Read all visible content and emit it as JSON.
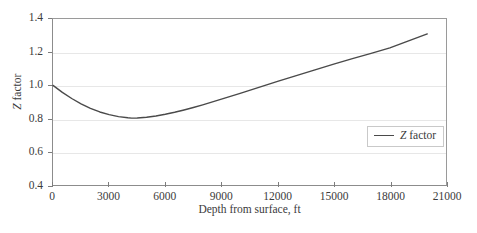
{
  "chart_data": {
    "type": "line",
    "title": "",
    "xlabel": "Depth from surface, ft",
    "ylabel": "Z factor",
    "ylabel_italic_prefix": "Z",
    "ylabel_rest": " factor",
    "xlim": [
      0,
      21000
    ],
    "ylim": [
      0.4,
      1.4
    ],
    "xticks": [
      0,
      3000,
      6000,
      9000,
      12000,
      15000,
      18000,
      21000
    ],
    "xtick_labels": [
      "0",
      "3000",
      "6000",
      "9000",
      "12000",
      "15000",
      "18000",
      "21000"
    ],
    "yticks": [
      0.4,
      0.6,
      0.8,
      1.0,
      1.2,
      1.4
    ],
    "ytick_labels": [
      "0.4",
      "0.6",
      "0.8",
      "1.0",
      "1.2",
      "1.4"
    ],
    "grid": true,
    "grid_axis": "y",
    "grid_color": "#e7e7e7",
    "frame_color": "#8c8c8c",
    "line_color": "#4a4a4a",
    "line_width": 1.4,
    "legend": {
      "position": "center-right",
      "entries": [
        {
          "label": "Z factor",
          "label_italic_prefix": "Z",
          "label_rest": " factor",
          "color": "#4a4a4a"
        }
      ]
    },
    "series": [
      {
        "name": "Z factor",
        "x": [
          0,
          500,
          1000,
          1500,
          2000,
          2500,
          3000,
          3500,
          4000,
          4200,
          4500,
          5000,
          5500,
          6000,
          6500,
          7000,
          7500,
          8000,
          9000,
          10000,
          11000,
          12000,
          13000,
          14000,
          15000,
          16000,
          17000,
          18000,
          19000,
          20000
        ],
        "y": [
          1.0,
          0.958,
          0.921,
          0.889,
          0.862,
          0.84,
          0.824,
          0.812,
          0.805,
          0.803,
          0.804,
          0.808,
          0.816,
          0.826,
          0.838,
          0.852,
          0.867,
          0.883,
          0.917,
          0.952,
          0.988,
          1.024,
          1.059,
          1.094,
          1.128,
          1.161,
          1.193,
          1.226,
          1.268,
          1.31
        ]
      }
    ]
  }
}
